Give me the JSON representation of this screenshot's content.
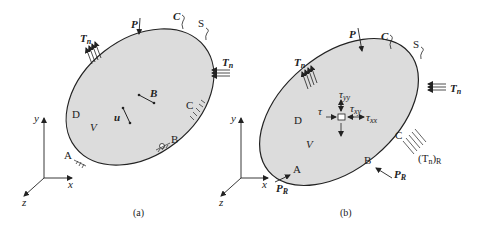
{
  "figure": {
    "colors": {
      "body_fill": "#dcdcdc",
      "outline": "#222222",
      "background": "#ffffff"
    },
    "panel_a": {
      "caption": "(a)",
      "labels": {
        "P": "P",
        "C_top": "C",
        "S": "S",
        "Tn_left": "T",
        "Tn_left_sub": "n",
        "Tn_right": "T",
        "Tn_right_sub": "n",
        "B_vec": "B",
        "u_vec": "u",
        "V": "V",
        "D": "D",
        "C_right": "C",
        "B_support": "B",
        "A": "A"
      },
      "axes": {
        "x": "x",
        "y": "y",
        "z": "z"
      }
    },
    "panel_b": {
      "caption": "(b)",
      "labels": {
        "P": "P",
        "C_top": "C",
        "S": "S",
        "Tn_left": "T",
        "Tn_left_sub": "n",
        "Tn_right": "T",
        "Tn_right_sub": "n",
        "tau_yy": "τ",
        "tau_yy_sub": "yy",
        "tau_xy": "τ",
        "tau_xy_sub": "xy",
        "tau_xx": "τ",
        "tau_xx_sub": "xx",
        "tau_left": "τ",
        "V": "V",
        "D": "D",
        "C_right": "C",
        "TnR": "(T",
        "TnR_sub": "n",
        "TnR_close": ")",
        "TnR_sub2": "R",
        "B": "B",
        "PR_right": "P",
        "PR_right_sub": "R",
        "A": "A",
        "PR_left": "P",
        "PR_left_sub": "R"
      },
      "axes": {
        "x": "x",
        "y": "y",
        "z": "z"
      }
    }
  }
}
